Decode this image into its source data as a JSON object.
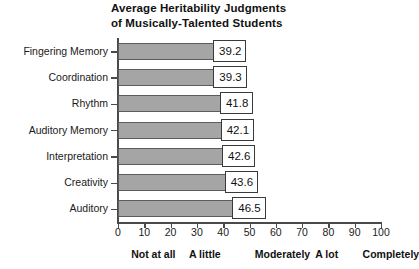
{
  "chart_data": {
    "type": "bar",
    "orientation": "horizontal",
    "title": "Average Heritability Judgments\nof Musically-Talented Students",
    "title_line1": "Average Heritability Judgments",
    "title_line2": "of Musically-Talented Students",
    "xlabel": "",
    "ylabel": "",
    "categories": [
      "Fingering Memory",
      "Coordination",
      "Rhythm",
      "Auditory Memory",
      "Interpretation",
      "Creativity",
      "Auditory"
    ],
    "values": [
      39.2,
      39.3,
      41.8,
      42.1,
      42.6,
      43.6,
      46.5
    ],
    "value_labels": [
      "39.2",
      "39.3",
      "41.8",
      "42.1",
      "42.6",
      "43.6",
      "46.5"
    ],
    "xlim": [
      0,
      100
    ],
    "xticks": [
      0,
      10,
      20,
      30,
      40,
      50,
      60,
      70,
      80,
      90,
      100
    ],
    "xtick_labels": [
      "0",
      "10",
      "20",
      "30",
      "40",
      "50",
      "60",
      "70",
      "80",
      "90",
      "100"
    ],
    "scale_anchors": [
      {
        "label": "Not at all",
        "value": 5
      },
      {
        "label": "A little",
        "value": 27
      },
      {
        "label": "Moderately",
        "value": 52
      },
      {
        "label": "A lot",
        "value": 75
      },
      {
        "label": "Completely",
        "value": 93
      }
    ],
    "grid": false,
    "legend": false,
    "bar_color": "#a5a5a5",
    "bar_edge_color": "#5c5c5c",
    "axis_color": "#4a4a4a",
    "background_color": "#ffffff"
  }
}
